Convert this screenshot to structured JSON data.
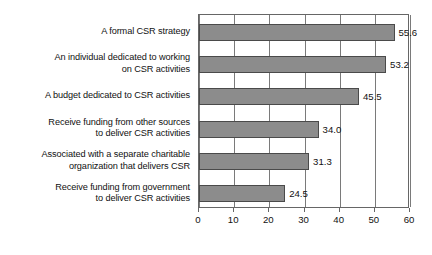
{
  "chart_data": {
    "type": "bar",
    "orientation": "horizontal",
    "title": "",
    "xlabel": "",
    "ylabel": "",
    "xlim": [
      0,
      60
    ],
    "xticks": [
      0,
      10,
      20,
      30,
      40,
      50,
      60
    ],
    "xtick_labels": [
      "0",
      "10",
      "20",
      "30",
      "40",
      "50",
      "60"
    ],
    "grid": "vertical",
    "legend": "none",
    "bar_color": "#8c8c8c",
    "bar_border_color": "#4a4a4a",
    "categories": [
      "A formal CSR strategy",
      "An individual dedicated to working\non CSR activities",
      "A budget dedicated to CSR activities",
      "Receive funding from other sources\nto deliver CSR activities",
      "Associated with a separate charitable\norganization that delivers CSR",
      "Receive funding from government\nto deliver CSR activities"
    ],
    "values": [
      55.6,
      53.2,
      45.5,
      34.0,
      31.3,
      24.5
    ],
    "value_labels": [
      "55.6",
      "53.2",
      "45.5",
      "34.0",
      "31.3",
      "24.5"
    ]
  }
}
